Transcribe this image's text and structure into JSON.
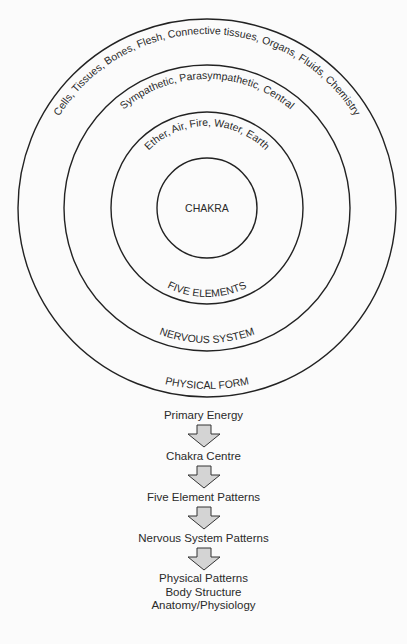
{
  "diagram": {
    "rings": [
      {
        "label": "CHAKRA",
        "sublabel": ""
      },
      {
        "label": "FIVE ELEMENTS",
        "sublabel": "Ether, Air, Fire, Water, Earth"
      },
      {
        "label": "NERVOUS SYSTEM",
        "sublabel": "Sympathetic, Parasympathetic, Central"
      },
      {
        "label": "PHYSICAL FORM",
        "sublabel": "Cells, Tissues, Bones, Flesh, Connective tissues, Organs, Fluids, Chemistry"
      }
    ],
    "colors": {
      "line": "#222222",
      "arrow_fill": "#d4d4d4",
      "background": "#fbfbfb"
    }
  },
  "flow": {
    "steps": [
      "Primary Energy",
      "Chakra Centre",
      "Five Element Patterns",
      "Nervous System Patterns"
    ],
    "final_lines": [
      "Physical Patterns",
      "Body Structure",
      "Anatomy/Physiology"
    ]
  }
}
